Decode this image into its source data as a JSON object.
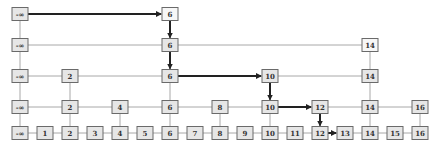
{
  "diagram": {
    "type": "skip-list",
    "colors": {
      "node_fill": "#e6e6e6",
      "node_fill_highlight": "#f7f7f7",
      "node_border": "#6a6a6a",
      "link": "#a8a8a8",
      "search_path": "#222222",
      "text": "#333333"
    },
    "layout": {
      "x0": 20,
      "dx": 25,
      "box_w": 16,
      "box_h": 13,
      "row_y": [
        133,
        107,
        76,
        45,
        14
      ]
    },
    "levels": [
      {
        "level": 0,
        "keys": [
          "-∞",
          "1",
          "2",
          "3",
          "4",
          "5",
          "6",
          "7",
          "8",
          "9",
          "10",
          "11",
          "12",
          "13",
          "14",
          "15",
          "16"
        ]
      },
      {
        "level": 1,
        "keys": [
          "-∞",
          "2",
          "4",
          "6",
          "8",
          "10",
          "12",
          "14",
          "16"
        ]
      },
      {
        "level": 2,
        "keys": [
          "-∞",
          "2",
          "6",
          "10",
          "14"
        ]
      },
      {
        "level": 3,
        "keys": [
          "-∞",
          "6",
          "14"
        ]
      },
      {
        "level": 4,
        "keys": [
          "-∞",
          "6"
        ]
      }
    ],
    "highlighted_nodes": [
      {
        "level": 4,
        "key": "6"
      },
      {
        "level": 3,
        "key": "14"
      }
    ],
    "search_path": [
      {
        "from": {
          "level": 4,
          "key": "-∞"
        },
        "to": {
          "level": 4,
          "key": "6"
        }
      },
      {
        "from": {
          "level": 4,
          "key": "6"
        },
        "to": {
          "level": 3,
          "key": "6"
        }
      },
      {
        "from": {
          "level": 3,
          "key": "6"
        },
        "to": {
          "level": 2,
          "key": "6"
        }
      },
      {
        "from": {
          "level": 2,
          "key": "6"
        },
        "to": {
          "level": 2,
          "key": "10"
        }
      },
      {
        "from": {
          "level": 2,
          "key": "10"
        },
        "to": {
          "level": 1,
          "key": "10"
        }
      },
      {
        "from": {
          "level": 1,
          "key": "10"
        },
        "to": {
          "level": 1,
          "key": "12"
        }
      },
      {
        "from": {
          "level": 1,
          "key": "12"
        },
        "to": {
          "level": 0,
          "key": "12"
        }
      },
      {
        "from": {
          "level": 0,
          "key": "12"
        },
        "to": {
          "level": 0,
          "key": "13"
        }
      }
    ]
  }
}
